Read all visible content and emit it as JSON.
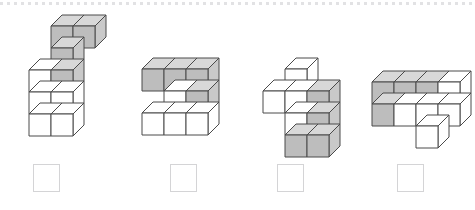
{
  "page": {
    "background_color": "#ffffff",
    "divider": {
      "style": "dotted",
      "color": "#e2e2e4"
    }
  },
  "render": {
    "cube_width": 22,
    "cube_height": 22,
    "depth_x": 11,
    "depth_y": 11,
    "stroke_color": "#4a4a4a",
    "stroke_width": 1,
    "face_colors": {
      "white_top": "#ffffff",
      "white_left": "#ffffff",
      "white_right": "#ffffff",
      "gray_top": "#d8d8d8",
      "gray_left": "#bdbdbd",
      "gray_right": "#c9c9c9"
    }
  },
  "figures": [
    {
      "id": "figure-1",
      "label": "Figure 1",
      "origin_x": 28,
      "origin_y": 14,
      "cubes": [
        {
          "x": 1,
          "y": 0,
          "z": 0,
          "shade": "gray"
        },
        {
          "x": 2,
          "y": 0,
          "z": 0,
          "shade": "gray"
        },
        {
          "x": 1,
          "y": 1,
          "z": 0,
          "shade": "gray"
        },
        {
          "x": 1,
          "y": 2,
          "z": 0,
          "shade": "gray"
        },
        {
          "x": 0,
          "y": 2,
          "z": 0,
          "shade": "white"
        },
        {
          "x": 0,
          "y": 3,
          "z": 0,
          "shade": "white"
        },
        {
          "x": 1,
          "y": 3,
          "z": 0,
          "shade": "white"
        },
        {
          "x": 0,
          "y": 4,
          "z": 0,
          "shade": "white"
        },
        {
          "x": 1,
          "y": 4,
          "z": 0,
          "shade": "white"
        }
      ],
      "answer_box": {
        "x": 33,
        "y": 164
      }
    },
    {
      "id": "figure-2",
      "label": "Figure 2",
      "origin_x": 141,
      "origin_y": 57,
      "cubes": [
        {
          "x": 0,
          "y": 0,
          "z": 0,
          "shade": "gray"
        },
        {
          "x": 1,
          "y": 0,
          "z": 0,
          "shade": "gray"
        },
        {
          "x": 2,
          "y": 0,
          "z": 0,
          "shade": "gray"
        },
        {
          "x": 1,
          "y": 1,
          "z": 0,
          "shade": "white"
        },
        {
          "x": 2,
          "y": 1,
          "z": 0,
          "shade": "gray"
        },
        {
          "x": 0,
          "y": 2,
          "z": 0,
          "shade": "white"
        },
        {
          "x": 1,
          "y": 2,
          "z": 0,
          "shade": "white"
        },
        {
          "x": 2,
          "y": 2,
          "z": 0,
          "shade": "white"
        }
      ],
      "answer_box": {
        "x": 170,
        "y": 164
      }
    },
    {
      "id": "figure-3",
      "label": "Figure 3",
      "origin_x": 262,
      "origin_y": 57,
      "cubes": [
        {
          "x": 1,
          "y": 0,
          "z": 0,
          "shade": "white"
        },
        {
          "x": 0,
          "y": 1,
          "z": 0,
          "shade": "white"
        },
        {
          "x": 1,
          "y": 1,
          "z": 0,
          "shade": "white"
        },
        {
          "x": 2,
          "y": 1,
          "z": 0,
          "shade": "gray"
        },
        {
          "x": 1,
          "y": 2,
          "z": 0,
          "shade": "white"
        },
        {
          "x": 2,
          "y": 2,
          "z": 0,
          "shade": "gray"
        },
        {
          "x": 1,
          "y": 3,
          "z": 0,
          "shade": "gray"
        },
        {
          "x": 2,
          "y": 3,
          "z": 0,
          "shade": "gray"
        }
      ],
      "answer_box": {
        "x": 277,
        "y": 164
      }
    },
    {
      "id": "figure-4",
      "label": "Figure 4",
      "origin_x": 371,
      "origin_y": 70,
      "cubes": [
        {
          "x": 0,
          "y": 0,
          "z": 0,
          "shade": "gray"
        },
        {
          "x": 1,
          "y": 0,
          "z": 0,
          "shade": "gray"
        },
        {
          "x": 2,
          "y": 0,
          "z": 0,
          "shade": "gray"
        },
        {
          "x": 3,
          "y": 0,
          "z": 0,
          "shade": "white"
        },
        {
          "x": 0,
          "y": 1,
          "z": 0,
          "shade": "gray"
        },
        {
          "x": 1,
          "y": 1,
          "z": 0,
          "shade": "white"
        },
        {
          "x": 2,
          "y": 1,
          "z": 0,
          "shade": "white"
        },
        {
          "x": 3,
          "y": 1,
          "z": 0,
          "shade": "white"
        },
        {
          "x": 2,
          "y": 2,
          "z": 0,
          "shade": "white"
        }
      ],
      "answer_box": {
        "x": 397,
        "y": 164
      }
    }
  ]
}
